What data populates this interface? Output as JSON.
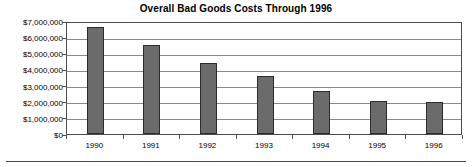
{
  "chart_data": {
    "type": "bar",
    "title": "Overall Bad Goods Costs Through 1996",
    "xlabel": "",
    "ylabel": "",
    "categories": [
      "1990",
      "1991",
      "1992",
      "1993",
      "1994",
      "1995",
      "1996"
    ],
    "values": [
      6600000,
      5500000,
      4400000,
      3620000,
      2650000,
      2050000,
      1980000
    ],
    "ylim": [
      0,
      7000000
    ],
    "ytick_values": [
      7000000,
      6000000,
      5000000,
      4000000,
      3000000,
      2000000,
      1000000,
      0
    ],
    "ytick_labels": [
      "$7,000,000",
      "$6,000,000",
      "$5,000,000",
      "$4,000,000",
      "$3,000,000",
      "$2,000,000",
      "$1,000,000",
      "$0"
    ],
    "grid": true,
    "legend": false,
    "series": [
      {
        "name": "Bad Goods Costs",
        "color": "#6b6b6b",
        "values": [
          6600000,
          5500000,
          4400000,
          3620000,
          2650000,
          2050000,
          1980000
        ]
      }
    ]
  },
  "colors": {
    "bar_fill": "#6b6b6b",
    "bar_border": "#2b2b2b",
    "gridline": "#888888",
    "axis": "#4d4d4d",
    "background": "#ffffff",
    "text": "#000000"
  }
}
